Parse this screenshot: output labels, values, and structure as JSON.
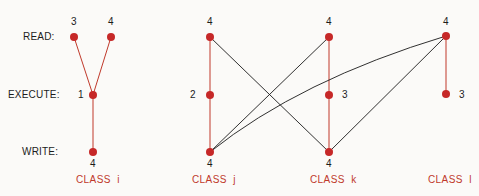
{
  "rows": {
    "read": "READ:",
    "execute": "EXECUTE:",
    "write": "WRITE:"
  },
  "classes": [
    {
      "label": "CLASS  i",
      "nodes": {
        "read": [
          "3",
          "4"
        ],
        "execute": "1",
        "write": "4"
      }
    },
    {
      "label": "CLASS  j",
      "nodes": {
        "read": "4",
        "execute": "2",
        "write": "4"
      }
    },
    {
      "label": "CLASS  k",
      "nodes": {
        "read": "4",
        "execute": "3",
        "write": "4"
      }
    },
    {
      "label": "CLASS  l",
      "nodes": {
        "read": "4",
        "execute": "3"
      }
    }
  ],
  "colors": {
    "node": "#c62828",
    "intra_edge": "#c0392b",
    "cross_edge": "#1a1a1a",
    "class_label": "#c0392b"
  }
}
